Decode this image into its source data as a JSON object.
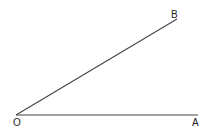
{
  "diagram": {
    "type": "angle",
    "stroke_color": "#444444",
    "label_color": "#222222",
    "points": {
      "O": {
        "label": "O",
        "x": 16,
        "y": 115
      },
      "A": {
        "label": "A",
        "x": 198,
        "y": 115
      },
      "B": {
        "label": "B",
        "x": 177,
        "y": 19
      }
    },
    "segments": [
      {
        "from": "O",
        "to": "A"
      },
      {
        "from": "O",
        "to": "B"
      }
    ]
  }
}
